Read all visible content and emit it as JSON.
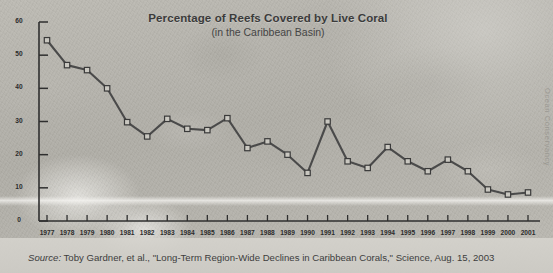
{
  "chart_data": {
    "type": "line",
    "title": "Percentage of Reefs Covered by Live Coral",
    "subtitle": "(in the Caribbean Basin)",
    "xlabel": "",
    "ylabel": "",
    "ylim": [
      0,
      60
    ],
    "yticks": [
      0,
      10,
      20,
      30,
      40,
      50,
      60
    ],
    "grid": false,
    "legend": "none",
    "marker": "square",
    "categories": [
      "1977",
      "1978",
      "1979",
      "1980",
      "1981",
      "1982",
      "1983",
      "1984",
      "1985",
      "1986",
      "1987",
      "1988",
      "1989",
      "1990",
      "1991",
      "1992",
      "1993",
      "1994",
      "1995",
      "1996",
      "1997",
      "1998",
      "1999",
      "2000",
      "2001"
    ],
    "x": [
      1977,
      1978,
      1979,
      1980,
      1981,
      1982,
      1983,
      1984,
      1985,
      1986,
      1987,
      1988,
      1989,
      1990,
      1991,
      1992,
      1993,
      1994,
      1995,
      1996,
      1997,
      1998,
      1999,
      2000,
      2001
    ],
    "values": [
      54.5,
      47,
      45.5,
      40,
      29.8,
      25.5,
      30.8,
      27.8,
      27.4,
      31,
      22,
      24,
      20,
      14.5,
      30,
      18,
      16,
      22.3,
      18,
      15,
      18.5,
      15,
      9.5,
      8,
      8.6
    ],
    "series": [
      {
        "name": "Percentage of reefs covered by live coral",
        "values": [
          54.5,
          47,
          45.5,
          40,
          29.8,
          25.5,
          30.8,
          27.8,
          27.4,
          31,
          22,
          24,
          20,
          14.5,
          30,
          18,
          16,
          22.3,
          18,
          15,
          18.5,
          15,
          9.5,
          8,
          8.6
        ]
      }
    ],
    "line_color": "#4a4a4a",
    "marker_fill": "#c9c7c0",
    "marker_edge": "#3a3a3a"
  },
  "chart": {
    "title": "Percentage of Reefs Covered by Live Coral",
    "subtitle": "(in the Caribbean Basin)"
  },
  "credit": {
    "text": "Ocean Conservancy"
  },
  "source": {
    "label": "Source:",
    "text": "Toby Gardner, et al., \"Long-Term Region-Wide Declines in Caribbean Corals,\" Science,  Aug. 15, 2003"
  },
  "colors": {
    "line": "#4a4a4a",
    "axis": "#2f2f2f",
    "marker_fill": "#c9c7c0",
    "text": "#333333",
    "background": "#b4b2ab"
  }
}
